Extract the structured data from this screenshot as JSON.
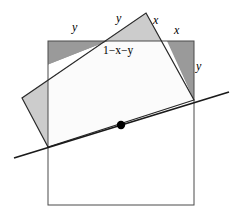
{
  "figure": {
    "type": "geometry-diagram",
    "width": 240,
    "height": 222,
    "background_color": "#ffffff",
    "colors": {
      "stroke": "#1a1a1a",
      "outer_square_fill": "#ffffff",
      "rotated_square_fill": "#cccccc",
      "overlap_fill": "#999999",
      "point_fill": "#000000",
      "line_stroke": "#1a1a1a"
    },
    "shapes": {
      "axis_aligned_square": {
        "name": "axis-aligned-square",
        "x": 48,
        "y": 41,
        "width": 146,
        "height": 164,
        "stroke_width": 1
      },
      "rotated_square": {
        "name": "rotated-square",
        "points": [
          [
            146,
            13
          ],
          [
            194,
            100
          ],
          [
            48,
            147
          ],
          [
            22,
            98
          ]
        ],
        "stroke_width": 1.2
      },
      "chord_line": {
        "name": "chord-line",
        "x1": 14,
        "y1": 158,
        "x2": 229,
        "y2": 92,
        "stroke_width": 1.6
      },
      "center_point": {
        "name": "center-point",
        "cx": 121,
        "cy": 125,
        "r": 4
      }
    },
    "labels": [
      {
        "id": "label-y-top-left",
        "text": "y",
        "x": 76,
        "y": 26,
        "kind": "variable"
      },
      {
        "id": "label-y-top-mid",
        "text": "y",
        "x": 120,
        "y": 18,
        "kind": "variable"
      },
      {
        "id": "label-x-top-right",
        "text": "x",
        "x": 157,
        "y": 20,
        "kind": "variable"
      },
      {
        "id": "label-x-right",
        "text": "x",
        "x": 177,
        "y": 30,
        "kind": "variable"
      },
      {
        "id": "label-y-right",
        "text": "y",
        "x": 198,
        "y": 66,
        "kind": "variable"
      },
      {
        "id": "label-one-minus-x-minus-y",
        "text": "1−x−y",
        "x": 104,
        "y": 45,
        "kind": "expression"
      }
    ],
    "label_values": {
      "y_top_left": "y",
      "y_top_mid": "y",
      "x_top_right": "x",
      "x_right": "x",
      "y_right": "y",
      "remainder": "1−x−y"
    }
  }
}
